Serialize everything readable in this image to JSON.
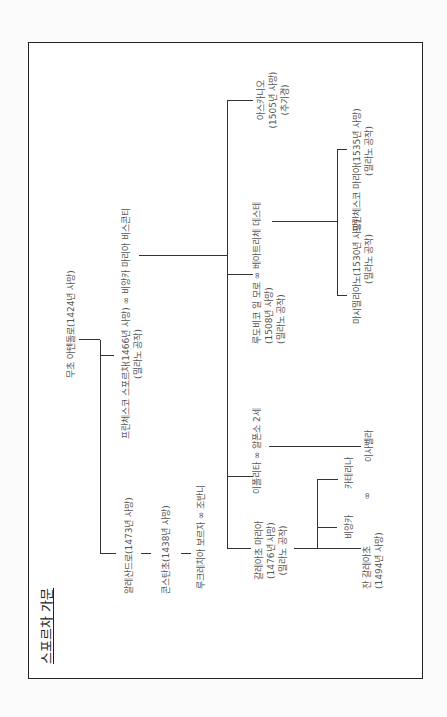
{
  "title": "스포르차 가문",
  "people": {
    "muzio": {
      "name": "무초 아텐돌로(1424년 사망)"
    },
    "francesco": {
      "line1": "프란체스코 스포르차(1466년 사망) ∞ 비앙카 마리아 비스콘티",
      "line2": "(밀라노 공작)"
    },
    "alessandro": {
      "name": "알레산드로(1473년 사망)"
    },
    "costanzo": {
      "name": "콘스탄초(1438년 사망)"
    },
    "giovanni": {
      "name": "루크레치아 보르자 ∞ 조반니"
    },
    "galeazzo": {
      "line1": "갈레아초 마리아",
      "line2": "(1476년 사망)",
      "line3": "(밀라노 공작)"
    },
    "ippolita": {
      "name": "이폴리타 ∞ 알폰소 2세"
    },
    "ludovico": {
      "line1": "루도비코 일 모로 ∞ 베아트리체 데스테",
      "line2": "(1508년 사망)",
      "line3": "(밀라노 공작)"
    },
    "ascanio": {
      "line1": "아스카니오",
      "line2": "(1505년 사망)",
      "line3": "(추기경)"
    },
    "bianca": {
      "name": "비앙카"
    },
    "caterina": {
      "name": "카테리나"
    },
    "gian_galeazzo": {
      "line1": "잔 갈레아초",
      "marriage": "∞",
      "line2": "(1494년 사망)"
    },
    "isabella": {
      "name": "이사벨라"
    },
    "massimiliano": {
      "line1": "마시밀리아노(1530년 사망)",
      "line2": "(밀라노 공작)"
    },
    "francesco_ii": {
      "line1": "프란체스코 마리아(1535년 사망)",
      "line2": "(밀라노 공작)"
    }
  }
}
